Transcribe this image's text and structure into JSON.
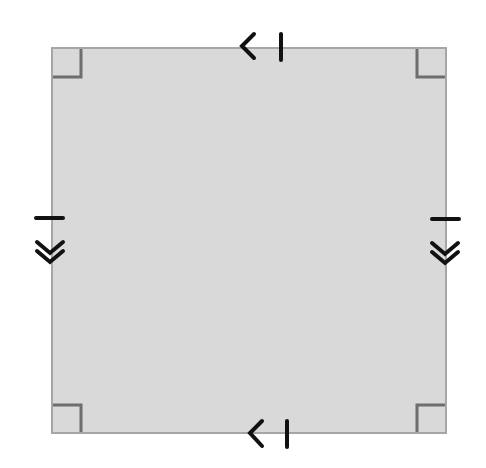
{
  "diagram": {
    "type": "square-with-markings",
    "shape": {
      "name": "square",
      "x": 52,
      "y": 48,
      "width": 394,
      "height": 385,
      "fill": "#d9d9d9",
      "stroke": "#a6a6a6"
    },
    "right_angle_markers": {
      "size": 28,
      "color": "#6e6e6e",
      "corners": [
        "top-left",
        "top-right",
        "bottom-left",
        "bottom-right"
      ]
    },
    "marks": {
      "color": "#111111",
      "top_side": {
        "symbol": "arrow-left-with-tick",
        "description": "< |"
      },
      "bottom_side": {
        "symbol": "arrow-left-with-tick",
        "description": "< |"
      },
      "left_side": {
        "symbol": "tick-with-double-chevron-down"
      },
      "right_side": {
        "symbol": "tick-with-double-chevron-down"
      }
    }
  }
}
